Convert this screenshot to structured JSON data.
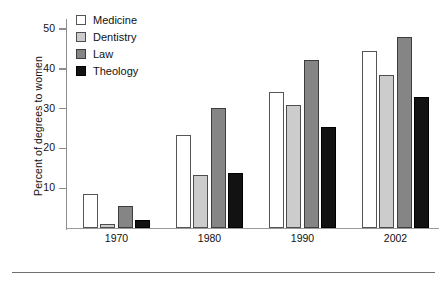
{
  "chart_data": {
    "type": "bar",
    "title": "",
    "subtitle": "",
    "xlabel": "",
    "ylabel": "Percent of degrees to women",
    "categories": [
      "1970",
      "1980",
      "1990",
      "2002"
    ],
    "series": [
      {
        "name": "Medicine",
        "color": "#ffffff",
        "values": [
          8.5,
          23.4,
          34.2,
          44.4
        ]
      },
      {
        "name": "Dentistry",
        "color": "#cccccc",
        "values": [
          1.0,
          13.3,
          30.9,
          38.4
        ]
      },
      {
        "name": "Law",
        "color": "#858585",
        "values": [
          5.5,
          30.2,
          42.2,
          47.9
        ]
      },
      {
        "name": "Theology",
        "color": "#121212",
        "values": [
          2.0,
          13.8,
          25.5,
          33.0
        ]
      }
    ],
    "ylim": [
      0,
      52
    ],
    "yticks": [
      10,
      20,
      30,
      40,
      50
    ],
    "ytick_labels": [
      "10",
      "20",
      "30",
      "40",
      "50"
    ],
    "grid": false,
    "legend_position": "top-left",
    "legend_entries": [
      "Medicine",
      "Dentistry",
      "Law",
      "Theology"
    ]
  },
  "axis": {
    "y_title": "Percent of degrees to women"
  },
  "legend": {
    "items": [
      {
        "label": "Medicine",
        "swatch": "medicine-swatch-icon"
      },
      {
        "label": "Dentistry",
        "swatch": "dentistry-swatch-icon"
      },
      {
        "label": "Law",
        "swatch": "law-swatch-icon"
      },
      {
        "label": "Theology",
        "swatch": "theology-swatch-icon"
      }
    ]
  }
}
